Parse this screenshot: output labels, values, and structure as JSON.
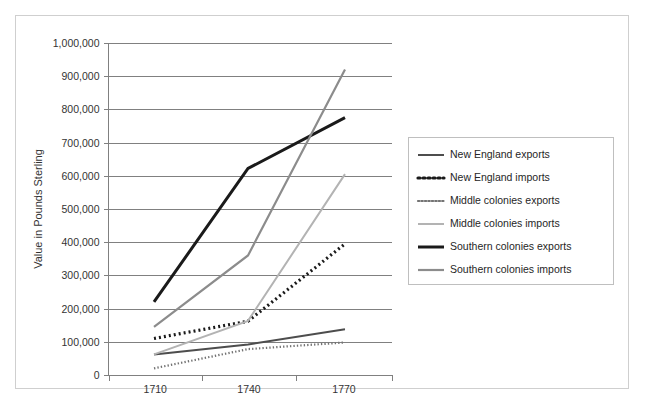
{
  "chart_data": {
    "type": "line",
    "title": "",
    "xlabel": "",
    "ylabel": "Value in Pounds Sterling",
    "x": [
      "1710",
      "1740",
      "1770"
    ],
    "categories": [
      "1710",
      "1740",
      "1770"
    ],
    "ylim": [
      0,
      1000000
    ],
    "ytick_labels": [
      "0",
      "100,000",
      "200,000",
      "300,000",
      "400,000",
      "500,000",
      "600,000",
      "700,000",
      "800,000",
      "900,000",
      "1,000,000"
    ],
    "ytick_values": [
      0,
      100000,
      200000,
      300000,
      400000,
      500000,
      600000,
      700000,
      800000,
      900000,
      1000000
    ],
    "grid": true,
    "legend_position": "right",
    "series": [
      {
        "name": "New England exports",
        "values": [
          62000,
          92000,
          138000
        ],
        "color": "#4d4d4d",
        "style": "solid",
        "width": 2.0
      },
      {
        "name": "New England imports",
        "values": [
          110000,
          162000,
          395000
        ],
        "color": "#1a1a1a",
        "style": "dotted",
        "width": 3.2
      },
      {
        "name": "Middle colonies exports",
        "values": [
          20000,
          78000,
          98000
        ],
        "color": "#737373",
        "style": "dotted",
        "width": 2.2
      },
      {
        "name": "Middle colonies imports",
        "values": [
          62000,
          163000,
          605000
        ],
        "color": "#b3b3b3",
        "style": "solid",
        "width": 2.0
      },
      {
        "name": "Southern colonies exports",
        "values": [
          220000,
          622000,
          775000
        ],
        "color": "#1a1a1a",
        "style": "solid",
        "width": 3.0
      },
      {
        "name": "Southern colonies imports",
        "values": [
          145000,
          360000,
          920000
        ],
        "color": "#8c8c8c",
        "style": "solid",
        "width": 2.2
      }
    ]
  },
  "legend": {
    "entries": [
      "New England exports",
      "New England imports",
      "Middle colonies exports",
      "Middle colonies imports",
      "Southern colonies exports",
      "Southern colonies imports"
    ]
  },
  "axes": {
    "y_title": "Value in Pounds Sterling"
  }
}
